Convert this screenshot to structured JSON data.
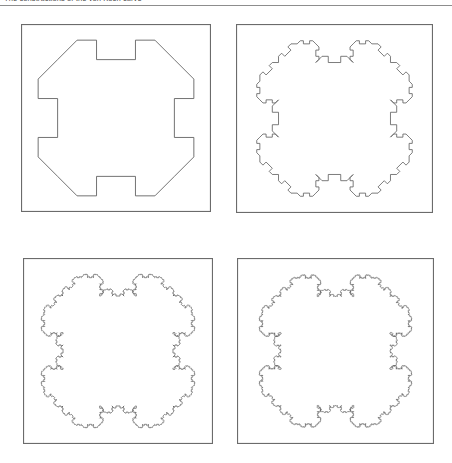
{
  "page": {
    "width": 452,
    "height": 463,
    "background_color": "#ffffff",
    "caption_clipped_text": "The constructions of the von Koch curve"
  },
  "style": {
    "curve_color": "#5a5a5a",
    "frame_color": "#6b6b6b",
    "rule_color": "#8d8d8d"
  },
  "figure": {
    "title": "",
    "panels": [
      {
        "name": "panel-iteration-1",
        "iteration": 1,
        "label": "",
        "x": 21,
        "y": 24,
        "width": 190,
        "height": 188,
        "stroke_width": 0.85
      },
      {
        "name": "panel-iteration-2",
        "iteration": 2,
        "label": "",
        "x": 236,
        "y": 24,
        "width": 197,
        "height": 189,
        "stroke_width": 0.8
      },
      {
        "name": "panel-iteration-3",
        "iteration": 3,
        "label": "",
        "x": 23,
        "y": 258,
        "width": 190,
        "height": 186,
        "stroke_width": 0.7
      },
      {
        "name": "panel-iteration-4",
        "iteration": 4,
        "label": "",
        "x": 237,
        "y": 258,
        "width": 197,
        "height": 186,
        "stroke_width": 0.55
      }
    ]
  },
  "chart_data": {
    "type": "line",
    "xlabel": "",
    "ylabel": "",
    "grid": false,
    "legend": "none",
    "curve_kind": "closed-polygon",
    "initiator": {
      "shape": "square",
      "vertices": [
        [
          0,
          0
        ],
        [
          1,
          0
        ],
        [
          1,
          1
        ],
        [
          0,
          1
        ]
      ],
      "traversal": "counterclockwise-in-svg-coords"
    },
    "generator": {
      "description": "Each straight segment of length L is replaced by an 8-piece motif: a 45-degree outward chamfer pair at each end plus a recessed flat middle, producing the bone/cross profile seen in iteration 1.",
      "segment_scale": 0.3333333333,
      "unit_path": [
        [
          0.0,
          0.0
        ],
        [
          0.16666667,
          0.16666667
        ],
        [
          0.33333333,
          0.16666667
        ],
        [
          0.33333333,
          0.0
        ],
        [
          0.66666667,
          0.0
        ],
        [
          0.66666667,
          0.16666667
        ],
        [
          0.83333333,
          0.16666667
        ],
        [
          1.0,
          0.0
        ]
      ],
      "note": "x runs along the parent segment, y is the outward normal offset (positive = away from interior)."
    },
    "iterations": [
      1,
      2,
      3,
      4
    ],
    "motif_counts": [
      1,
      8,
      64,
      512
    ],
    "fractal_dimension": 1.5,
    "series": [
      {
        "name": "iteration 1",
        "values": [
          1
        ]
      },
      {
        "name": "iteration 2",
        "values": [
          8
        ]
      },
      {
        "name": "iteration 3",
        "values": [
          64
        ]
      },
      {
        "name": "iteration 4",
        "values": [
          512
        ]
      }
    ]
  }
}
